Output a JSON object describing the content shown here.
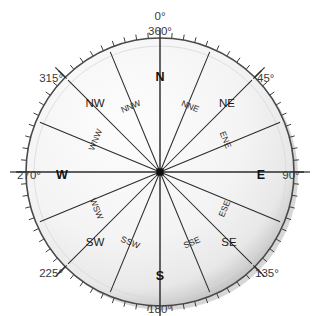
{
  "figure": {
    "name": "compass-rose",
    "center": {
      "x": 160,
      "y": 172
    },
    "radius": 134,
    "colors": {
      "rim": "#4a4a4a",
      "face_light": "#fbfbfb",
      "face_mid": "#eeeeee",
      "face_shadow": "#cfcfcf",
      "spoke": "#2b2b2b",
      "tick": "#3f3f3f",
      "hub": "#111111",
      "text": "#1a1a1a",
      "degree_text": "#3a3a3a",
      "background": "#ffffff"
    }
  },
  "degree_labels": [
    {
      "id": "deg-0",
      "text": "0°",
      "x": 160,
      "y": 17,
      "anchor": "middle"
    },
    {
      "id": "deg-360",
      "text": "360°",
      "x": 160,
      "y": 32,
      "anchor": "middle"
    },
    {
      "id": "deg-45",
      "text": "45°",
      "x": 257,
      "y": 79,
      "anchor": "start"
    },
    {
      "id": "deg-90",
      "text": "90°",
      "x": 291,
      "y": 176,
      "anchor": "middle"
    },
    {
      "id": "deg-135",
      "text": "135°",
      "x": 255,
      "y": 274,
      "anchor": "start"
    },
    {
      "id": "deg-180",
      "text": "180°",
      "x": 160,
      "y": 310,
      "anchor": "middle"
    },
    {
      "id": "deg-225",
      "text": "225°",
      "x": 63,
      "y": 274,
      "anchor": "end"
    },
    {
      "id": "deg-270",
      "text": "270°",
      "x": 29,
      "y": 176,
      "anchor": "middle"
    },
    {
      "id": "deg-315",
      "text": "315°",
      "x": 63,
      "y": 79,
      "anchor": "end"
    }
  ],
  "cardinal_points": [
    {
      "id": "dir-N",
      "text": "N",
      "bearing": 0,
      "x": 160,
      "y": 78,
      "anchor": "middle"
    },
    {
      "id": "dir-E",
      "text": "E",
      "bearing": 90,
      "x": 261,
      "y": 176,
      "anchor": "middle"
    },
    {
      "id": "dir-S",
      "text": "S",
      "bearing": 180,
      "x": 160,
      "y": 277,
      "anchor": "middle"
    },
    {
      "id": "dir-W",
      "text": "W",
      "bearing": 270,
      "x": 62,
      "y": 176,
      "anchor": "middle"
    }
  ],
  "ordinal_points": [
    {
      "id": "dir-NE",
      "text": "NE",
      "bearing": 45,
      "x": 227,
      "y": 104,
      "anchor": "middle"
    },
    {
      "id": "dir-SE",
      "text": "SE",
      "bearing": 135,
      "x": 229,
      "y": 243,
      "anchor": "middle"
    },
    {
      "id": "dir-SW",
      "text": "SW",
      "bearing": 225,
      "x": 95,
      "y": 243,
      "anchor": "middle"
    },
    {
      "id": "dir-NW",
      "text": "NW",
      "bearing": 315,
      "x": 95,
      "y": 104,
      "anchor": "middle"
    }
  ],
  "secondary_points": [
    {
      "id": "dir-NNE",
      "text": "NNE",
      "bearing": 22.5,
      "x": 190,
      "y": 107,
      "rotate": 22.5
    },
    {
      "id": "dir-ENE",
      "text": "ENE",
      "bearing": 67.5,
      "x": 225,
      "y": 140,
      "rotate": 67.5
    },
    {
      "id": "dir-ESE",
      "text": "ESE",
      "bearing": 112.5,
      "x": 225,
      "y": 209,
      "rotate": -67.5
    },
    {
      "id": "dir-SSE",
      "text": "SSE",
      "bearing": 157.5,
      "x": 192,
      "y": 243,
      "rotate": -22.5
    },
    {
      "id": "dir-SSW",
      "text": "SSW",
      "bearing": 202.5,
      "x": 130,
      "y": 243,
      "rotate": 22.5
    },
    {
      "id": "dir-WSW",
      "text": "WSW",
      "bearing": 247.5,
      "x": 96,
      "y": 209,
      "rotate": 67.5
    },
    {
      "id": "dir-WNW",
      "text": "WNW",
      "bearing": 292.5,
      "x": 96,
      "y": 140,
      "rotate": -67.5
    },
    {
      "id": "dir-NNW",
      "text": "NNW",
      "bearing": 337.5,
      "x": 131,
      "y": 107,
      "rotate": -22.5
    }
  ],
  "spokes": {
    "count": 16,
    "bearings": [
      0,
      22.5,
      45,
      67.5,
      90,
      112.5,
      135,
      157.5,
      180,
      202.5,
      225,
      247.5,
      270,
      292.5,
      315,
      337.5
    ]
  },
  "ticks": {
    "interval_degrees": 5,
    "count": 72,
    "major_every_degrees": 45
  },
  "chart_data": {
    "type": "compass-rose",
    "units": "degrees",
    "range": [
      0,
      360
    ],
    "points": [
      {
        "label": "N",
        "bearing": 0,
        "degree_text": "0° / 360°"
      },
      {
        "label": "NNE",
        "bearing": 22.5,
        "degree_text": ""
      },
      {
        "label": "NE",
        "bearing": 45,
        "degree_text": "45°"
      },
      {
        "label": "ENE",
        "bearing": 67.5,
        "degree_text": ""
      },
      {
        "label": "E",
        "bearing": 90,
        "degree_text": "90°"
      },
      {
        "label": "ESE",
        "bearing": 112.5,
        "degree_text": ""
      },
      {
        "label": "SE",
        "bearing": 135,
        "degree_text": "135°"
      },
      {
        "label": "SSE",
        "bearing": 157.5,
        "degree_text": ""
      },
      {
        "label": "S",
        "bearing": 180,
        "degree_text": "180°"
      },
      {
        "label": "SSW",
        "bearing": 202.5,
        "degree_text": ""
      },
      {
        "label": "SW",
        "bearing": 225,
        "degree_text": "225°"
      },
      {
        "label": "WSW",
        "bearing": 247.5,
        "degree_text": ""
      },
      {
        "label": "W",
        "bearing": 270,
        "degree_text": "270°"
      },
      {
        "label": "WNW",
        "bearing": 292.5,
        "degree_text": ""
      },
      {
        "label": "NW",
        "bearing": 315,
        "degree_text": "315°"
      },
      {
        "label": "NNW",
        "bearing": 337.5,
        "degree_text": ""
      }
    ]
  }
}
